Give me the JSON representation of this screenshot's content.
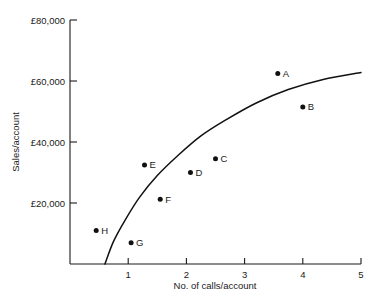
{
  "chart_data": {
    "type": "scatter",
    "title": "",
    "xlabel": "No. of calls/account",
    "ylabel": "Sales/account",
    "xlim": [
      0,
      5
    ],
    "ylim": [
      0,
      80000
    ],
    "grid": false,
    "legend": "none",
    "x_ticks": [
      {
        "value": 1,
        "label": "1"
      },
      {
        "value": 2,
        "label": "2"
      },
      {
        "value": 3,
        "label": "3"
      },
      {
        "value": 4,
        "label": "4"
      },
      {
        "value": 5,
        "label": "5"
      }
    ],
    "y_ticks": [
      {
        "value": 20000,
        "label": "£20,000"
      },
      {
        "value": 40000,
        "label": "£40,000"
      },
      {
        "value": 60000,
        "label": "£60,000"
      },
      {
        "value": 80000,
        "label": "£80,000"
      }
    ],
    "points": [
      {
        "label": "A",
        "x": 3.57,
        "y": 62500
      },
      {
        "label": "B",
        "x": 4.0,
        "y": 51500
      },
      {
        "label": "C",
        "x": 2.5,
        "y": 34500
      },
      {
        "label": "D",
        "x": 2.07,
        "y": 30000
      },
      {
        "label": "E",
        "x": 1.28,
        "y": 32500
      },
      {
        "label": "F",
        "x": 1.55,
        "y": 21200
      },
      {
        "label": "G",
        "x": 1.05,
        "y": 7000
      },
      {
        "label": "H",
        "x": 0.45,
        "y": 11000
      }
    ],
    "fit_curve": {
      "name": "trend-curve",
      "points": [
        {
          "x": 0.6,
          "y": 0
        },
        {
          "x": 0.75,
          "y": 7500
        },
        {
          "x": 0.95,
          "y": 14500
        },
        {
          "x": 1.2,
          "y": 22000
        },
        {
          "x": 1.5,
          "y": 29000
        },
        {
          "x": 1.85,
          "y": 35500
        },
        {
          "x": 2.25,
          "y": 42000
        },
        {
          "x": 2.7,
          "y": 47500
        },
        {
          "x": 3.2,
          "y": 52800
        },
        {
          "x": 3.75,
          "y": 57200
        },
        {
          "x": 4.35,
          "y": 60500
        },
        {
          "x": 5.0,
          "y": 62800
        }
      ]
    },
    "colors": {
      "axis": "#1a1a1a",
      "curve": "#111111",
      "point": "#111111",
      "background": "#ffffff"
    }
  }
}
